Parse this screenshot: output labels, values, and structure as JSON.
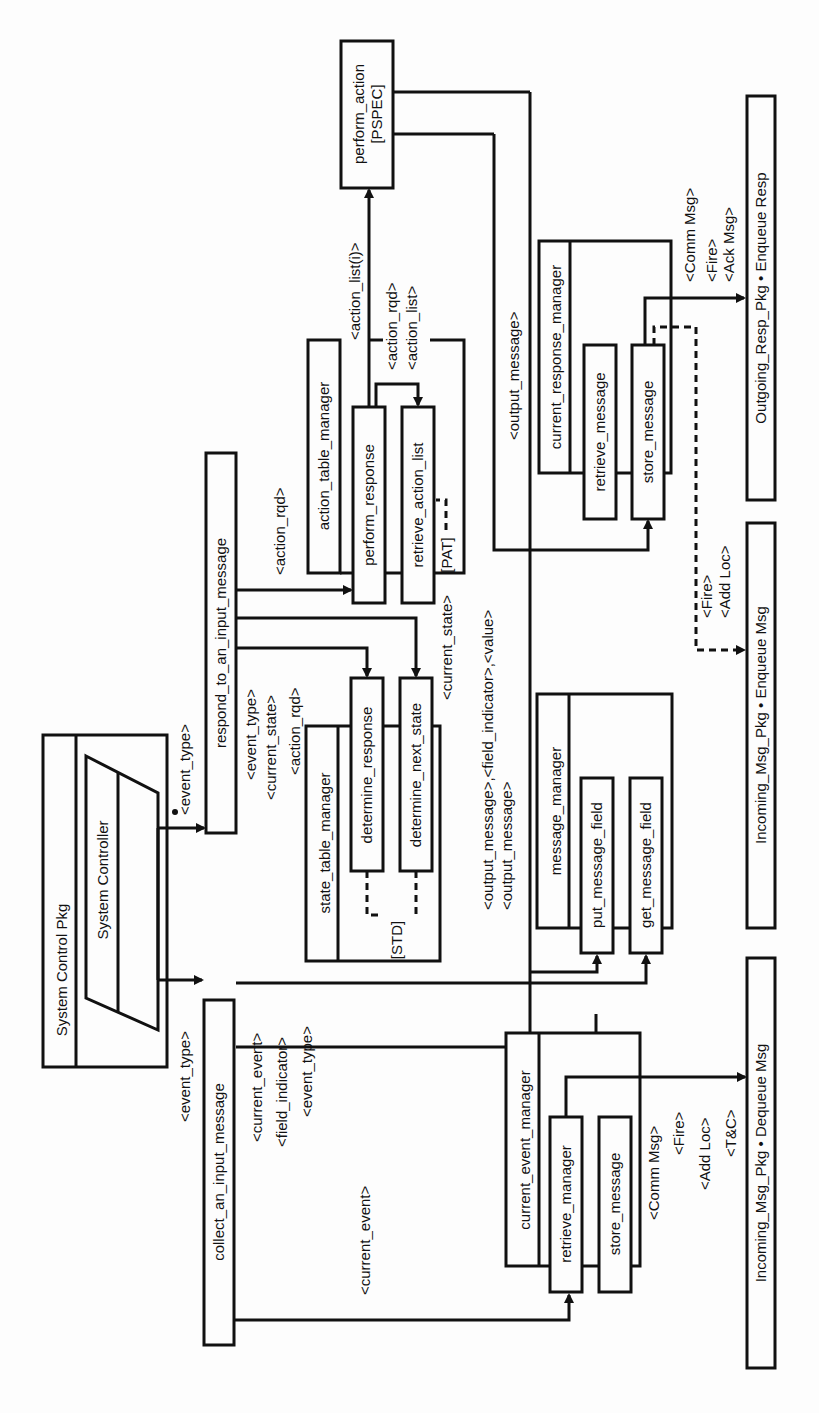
{
  "diagram": {
    "orientation": "rotated-90-ccw",
    "package": {
      "title": "System Control Pkg",
      "controller": "System Controller"
    },
    "modules": {
      "respond": "respond_to_an_input_message",
      "collect": "collect_an_input_message",
      "perform_action": "perform_action",
      "perform_action_tag": "[PSPEC]",
      "action_table_manager": "action_table_manager",
      "perform_response": "perform_response",
      "retrieve_action_list": "retrieve_action_list",
      "retrieve_action_list_tag": "[PAT]",
      "state_table_manager": "state_table_manager",
      "determine_response": "determine_response",
      "determine_next_state": "determine_next_state",
      "state_table_tag": "[STD]",
      "message_manager": "message_manager",
      "put_message_field": "put_message_field",
      "get_message_field": "get_message_field",
      "current_response_manager": "current_response_manager",
      "crm_retrieve_message": "retrieve_message",
      "crm_store_message": "store_message",
      "current_event_manager": "current_event_manager",
      "cem_retrieve_manager": "retrieve_manager",
      "cem_store_message": "store_message",
      "outgoing_resp": "Outgoing_Resp_Pkg • Enqueue  Resp",
      "incoming_enqueue": "Incoming_Msg_Pkg • Enqueue  Msg",
      "incoming_dequeue": "Incoming_Msg_Pkg • Dequeue Msg"
    },
    "couples": {
      "event_type_respond": "<event_type>",
      "event_type_collect": "<event_type>",
      "action_rqd_perform": "<action_rqd>",
      "action_list_i": "<action_list(i)>",
      "action_rqd_retrieve": "<action_rqd>",
      "action_list": "<action_list>",
      "std_event_type": "<event_type>",
      "std_current_state": "<current_state>",
      "std_action_rqd": "<action_rqd>",
      "current_state": "<current_state>",
      "put_fields": "<output_message>,<field_indicator>,<value>",
      "get_output": "<output_message>",
      "store_output": "<output_message>",
      "collect_current_event": "<current_event>",
      "collect_field_indicator": "<field_indicator>",
      "collect_event_type": "<event_type>",
      "retrieve_current_event": "<current_event>",
      "resp_comm_msg": "<Comm Msg>",
      "resp_fire": "<Fire>",
      "resp_ack_msg": "<Ack Msg>",
      "enq_fire": "<Fire>",
      "enq_add_loc": "<Add Loc>",
      "deq_comm_msg": "<Comm Msg>",
      "deq_fire": "<Fire>",
      "deq_add_loc": "<Add Loc>",
      "deq_tc": "<T&C>"
    }
  }
}
